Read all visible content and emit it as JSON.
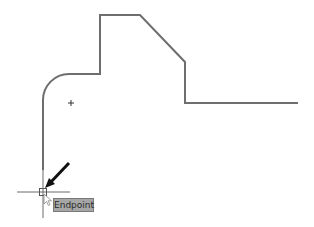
{
  "viewport": {
    "description": "CAD drawing area with polyline profile and object snap marker",
    "background_color": "#ffffff",
    "line_color": "#6e6e6e"
  },
  "drawing": {
    "profile_polyline": [
      [
        43,
        170
      ],
      [
        43,
        100
      ],
      [
        69,
        74
      ],
      [
        100,
        74
      ],
      [
        100,
        15
      ],
      [
        140,
        15
      ],
      [
        185,
        62
      ],
      [
        185,
        103
      ],
      [
        298,
        103
      ]
    ],
    "arc_center_marker": {
      "x": 71,
      "y": 103
    }
  },
  "cursor": {
    "crosshair_x": 43,
    "crosshair_y": 192,
    "snap_marker": "endpoint-square"
  },
  "callout_arrow": {
    "from": [
      69,
      163
    ],
    "to": [
      47,
      187
    ]
  },
  "snap_tooltip": {
    "label": "Endpoint"
  }
}
